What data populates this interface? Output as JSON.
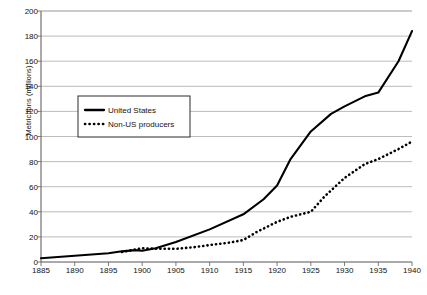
{
  "chart_data": {
    "type": "line",
    "title": "",
    "xlabel": "",
    "ylabel": "Metric tons (millions)",
    "xlim": [
      1885,
      1940
    ],
    "ylim": [
      0,
      200
    ],
    "ytick_step": 20,
    "xtick_step": 5,
    "grid": "horizontal",
    "legend_position": "upper-left-inside",
    "categories": [
      1885,
      1890,
      1895,
      1900,
      1905,
      1910,
      1915,
      1920,
      1925,
      1930,
      1935,
      1940
    ],
    "xticklabels": [
      "1885",
      "1890",
      "1895",
      "1900",
      "1905",
      "1910",
      "1915",
      "1920",
      "1925",
      "1930",
      "1935",
      "1940"
    ],
    "yticklabels": [
      "0",
      "20",
      "40",
      "60",
      "80",
      "100",
      "120",
      "140",
      "160",
      "180",
      "200"
    ],
    "series": [
      {
        "name": "United States",
        "style": "solid",
        "color": "#000000",
        "x": [
          1885,
          1890,
          1895,
          1897,
          1899,
          1900,
          1902,
          1905,
          1910,
          1915,
          1918,
          1920,
          1922,
          1925,
          1928,
          1930,
          1933,
          1935,
          1938,
          1940
        ],
        "values": [
          3,
          5,
          7,
          8.5,
          9.5,
          9,
          11,
          16,
          26,
          38,
          50,
          61,
          82,
          104,
          118,
          124,
          132,
          135,
          160,
          184
        ]
      },
      {
        "name": "Non-US producers",
        "style": "dotted",
        "color": "#000000",
        "x": [
          1897,
          1899,
          1900,
          1902,
          1905,
          1908,
          1910,
          1913,
          1915,
          1917,
          1920,
          1922,
          1925,
          1927,
          1930,
          1933,
          1935,
          1938,
          1940
        ],
        "values": [
          8,
          10,
          11,
          10.5,
          10.5,
          12,
          13.5,
          15.5,
          17.5,
          24,
          32,
          36,
          40,
          52,
          67,
          78,
          82,
          90,
          96
        ]
      }
    ]
  },
  "legend": {
    "items": [
      {
        "label": "United States",
        "style": "solid"
      },
      {
        "label": "Non-US producers",
        "style": "dotted"
      }
    ]
  },
  "caption": {
    "text": ""
  }
}
